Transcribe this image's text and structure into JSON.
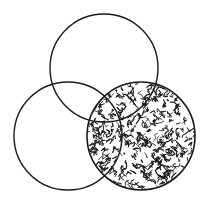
{
  "diagram": {
    "type": "venn",
    "background": "#ffffff",
    "stroke_color": "#1a1a1a",
    "texture_color": "#1a1a1a",
    "circles": [
      {
        "id": "top",
        "cx": 104,
        "cy": 68,
        "r": 54,
        "shaded": false
      },
      {
        "id": "left",
        "cx": 68,
        "cy": 136,
        "r": 54,
        "shaded": false
      },
      {
        "id": "right",
        "cx": 141,
        "cy": 136,
        "r": 54,
        "shaded": true
      }
    ],
    "shaded_region": "right circle (entire)"
  }
}
